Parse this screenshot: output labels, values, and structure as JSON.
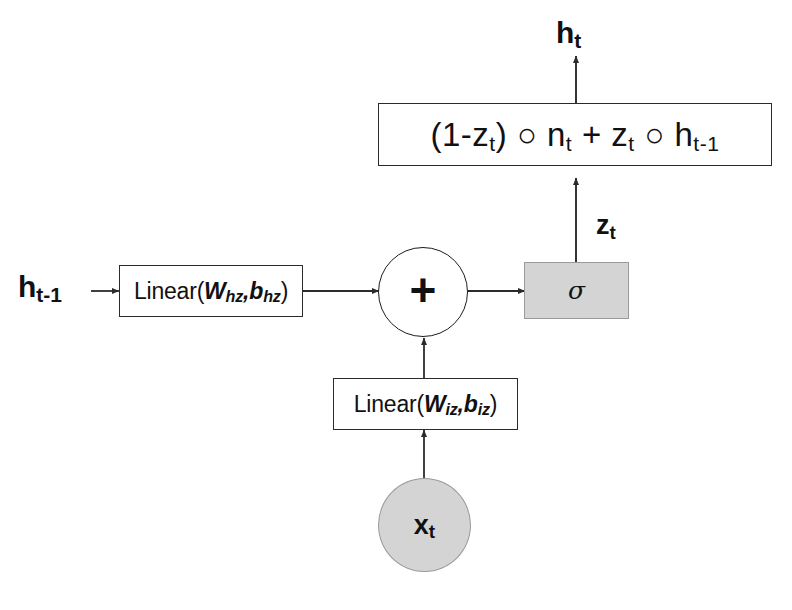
{
  "diagram": {
    "colors": {
      "stroke": "#2b2b2b",
      "shaded_fill": "#d4d4d4",
      "shaded_stroke": "#9a9a9a",
      "text": "#111111",
      "background": "#ffffff"
    },
    "nodes": {
      "output_label": {
        "base": "h",
        "sub": "t"
      },
      "formula_box": {
        "parts": [
          {
            "text": "(1-z"
          },
          {
            "sub": "t"
          },
          {
            "text": ") ○ n"
          },
          {
            "sub": "t"
          },
          {
            "text": " + z"
          },
          {
            "sub": "t"
          },
          {
            "text": " ○ h"
          },
          {
            "sub": "t-1"
          }
        ],
        "plain": "(1-z_t) ○ n_t + z_t ○ h_t-1"
      },
      "gate_label": {
        "base": "z",
        "sub": "t"
      },
      "sigma_box": {
        "symbol": "σ"
      },
      "hidden_input_label": {
        "base": "h",
        "sub": "t-1"
      },
      "linear_h": {
        "prefix": "Linear(",
        "weight": "W",
        "weight_sub": "hz",
        "separator": ",",
        "bias": "b",
        "bias_sub": "hz",
        "suffix": ")",
        "plain": "Linear(W_hz,b_hz)"
      },
      "adder": {
        "symbol": "+"
      },
      "linear_i": {
        "prefix": "Linear(",
        "weight": "W",
        "weight_sub": "iz",
        "separator": ",",
        "bias": "b",
        "bias_sub": "iz",
        "suffix": ")",
        "plain": "Linear(W_iz,b_iz)"
      },
      "input_label": {
        "base": "x",
        "sub": "t"
      }
    }
  }
}
